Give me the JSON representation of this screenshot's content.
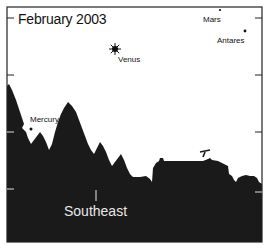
{
  "title": "February 2003",
  "direction_label": "Southeast",
  "objects": [
    {
      "name": "Venus",
      "type": "planet-bright",
      "x": 115,
      "y": 49,
      "label_x": 118,
      "label_y": 55
    },
    {
      "name": "Mars",
      "type": "planet",
      "x": 220,
      "y": 10,
      "label_x": 203,
      "label_y": 15
    },
    {
      "name": "Antares",
      "type": "star",
      "x": 245,
      "y": 31,
      "label_x": 217,
      "label_y": 37
    },
    {
      "name": "Mercury",
      "type": "planet",
      "x": 31,
      "y": 129,
      "label_x": 30,
      "label_y": 116
    }
  ],
  "frame": {
    "left": 7,
    "top": 7,
    "right": 262,
    "bottom": 242
  },
  "ticks_y": [
    18,
    75,
    132,
    189
  ],
  "colors": {
    "sky": "#ffffff",
    "ground": "#1a1a1a",
    "frame": "#222222",
    "direction_text": "#e8e8e8"
  }
}
